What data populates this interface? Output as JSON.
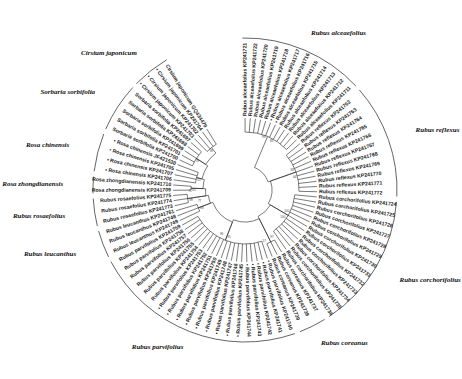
{
  "diagram": {
    "type": "circular-phylogenetic-tree",
    "clades": [
      {
        "name": "Rubus alceaefolius",
        "tips": [
          "Rubus alceaefolius KP241721",
          "Rubus alceaefolius KP241722",
          "Rubus alceaefolius KP241720",
          "Rubus alceaefolius KP241719",
          "Rubus alceaefolius KP241718",
          "Rubus alceaefolius KP241717",
          "Rubus alceaefolius KP241716",
          "Rubus alceaefolius KP241715",
          "Rubus alceaefolius KP241714",
          "Rubus alceaefolius KP241713",
          "Rubus alceaefolius KP241712",
          "Rubus alceaefolius KP241711"
        ],
        "marked": [
          5,
          6
        ]
      },
      {
        "name": "Rubus reflexus",
        "tips": [
          "Rubus reflexus KP241762",
          "Rubus reflexus KP241763",
          "Rubus reflexus KP241764",
          "Rubus reflexus KP241765",
          "Rubus reflexus KP241766",
          "Rubus reflexus KP241767",
          "Rubus reflexus KP241768",
          "Rubus reflexus KP241769",
          "Rubus reflexus KP241770",
          "Rubus reflexus KP241771",
          "Rubus reflexus KP241772"
        ],
        "marked": []
      },
      {
        "name": "Rubus corchorifolius",
        "tips": [
          "Rubus corchorifolius KP241724",
          "Rubus corchorifolius KP241725",
          "Rubus corchorifolius KP241726",
          "Rubus corchorifolius KP241727",
          "Rubus corchorifolius KP241728",
          "Rubus corchorifolius KP241729",
          "Rubus corchorifolius KP241730",
          "Rubus corchorifolius KP241731",
          "Rubus corchorifolius KP241732",
          "Rubus corchorifolius KP241733",
          "Rubus corchorifolius KP241734",
          "Rubus corchorifolius KP241735",
          "Rubus corchorifolius KP241736"
        ],
        "marked": []
      },
      {
        "name": "Rubus coreanus",
        "tips": [
          "Rubus coreanus KP241737",
          "Rubus coreanus KP241738",
          "Rubus coreanus KP241739"
        ],
        "marked": []
      },
      {
        "name": "Rubus parvifolius",
        "tips": [
          "Rubus parvifolius KP241740",
          "Rubus parvifolius KP241741",
          "Rubus parvifolius KP241742",
          "Rubus parvifolius KP241743",
          "Rubus parvifolius KP241744",
          "Rubus parvifolius KP241745",
          "Rubus parvifolius KP241746",
          "Rubus parvifolius KP241747",
          "Rubus parvifolius KP241748",
          "Rubus parvifolius KP241749",
          "Rubus parvifolius KP241750",
          "Rubus parvifolius KP241751",
          "Rubus parvifolius KP241752",
          "Rubus parvifolius KP241753",
          "Rubus parvifolius KP241754",
          "Rubus parvifolius KP241755",
          "Rubus parvifolius KP241756",
          "Rubus parvifolius KP241757",
          "Rubus parvifolius KP241758",
          "Rubus parvifolius KP241759"
        ],
        "marked": [
          0,
          1,
          2,
          3,
          4,
          5,
          6,
          7,
          8,
          9,
          10,
          11,
          12,
          13
        ]
      },
      {
        "name": "Rubus leucanthus",
        "tips": [
          "Rubus leucanthus KP241749",
          "Rubus leucanthus KP241748",
          "Rubus leucanthus KP241761"
        ],
        "marked": []
      },
      {
        "name": "Rubus rosaefolius",
        "tips": [
          "Rubus rosaefolius KP241773",
          "Rubus rosaefolius KP241774",
          "Rubus rosaefolius KP241775"
        ],
        "marked": []
      },
      {
        "name": "Rosa zhongdianensis",
        "tips": [
          "Rosa zhongdianensis KP241709",
          "Rosa zhongdianensis KP241710"
        ],
        "marked": []
      },
      {
        "name": "Rosa chinensis",
        "tips": [
          "Rosa chinensis KP241706",
          "Rosa chinensis KP241707",
          "Rosa chinensis KP241705",
          "Rosa chinensis JF421530"
        ],
        "marked": [
          0,
          1,
          2,
          3
        ]
      },
      {
        "name": "Sorbaria sorbifolia",
        "tips": [
          "Sorbaria sorbifolia KP241700",
          "Sorbaria sorbifolia KP241701",
          "Sorbaria sorbifolia KP241699",
          "Sorbaria sorbifolia KP241698",
          "Sorbaria sorbifolia KP241697"
        ],
        "marked": []
      },
      {
        "name": "Cirsium japonicum",
        "tips": [
          "Cirsium japonicum KP241703",
          "Cirsium japonicum KP241702",
          "Cirsium japonicum KP241704",
          "Cirsium japonicum GQ434479"
        ],
        "marked": [
          0,
          1,
          2
        ]
      }
    ],
    "bootstrap_values": [
      "99",
      "98",
      "100",
      "97",
      "95",
      "88",
      "99",
      "65",
      "51",
      "78",
      "99",
      "85",
      "64",
      "100",
      "57",
      "99",
      "77",
      "71"
    ]
  }
}
